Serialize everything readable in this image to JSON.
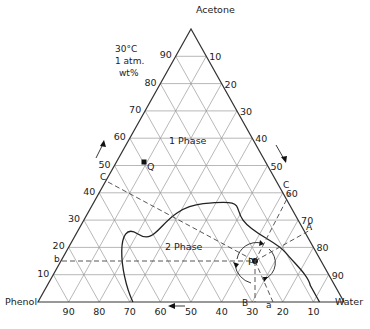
{
  "diagram": {
    "title_vertex_top": "Acetone",
    "vertex_left": "Phenol",
    "vertex_right": "Water",
    "conditions": [
      "30°C",
      "1 atm.",
      "wt%"
    ],
    "region_labels": {
      "one_phase": "1 Phase",
      "two_phase": "2 Phase"
    },
    "points": {
      "P": "P",
      "Q": "Q"
    },
    "line_labels": {
      "a": "a",
      "b": "b",
      "B": "B",
      "A": "A",
      "C_left": "C",
      "C_right": "C"
    },
    "left_ticks": [
      "10",
      "20",
      "30",
      "40",
      "50",
      "60",
      "70",
      "80",
      "90"
    ],
    "right_ticks": [
      "10",
      "20",
      "30",
      "40",
      "50",
      "60",
      "70",
      "80",
      "90"
    ],
    "bottom_ticks": [
      "90",
      "80",
      "70",
      "60",
      "50",
      "40",
      "30",
      "20",
      "10"
    ],
    "colors": {
      "grid": "#9a9a9a",
      "frame": "#333333",
      "curve": "#222222",
      "dash": "#444444"
    }
  },
  "chart_data": {
    "type": "ternary",
    "components": [
      "Acetone",
      "Phenol",
      "Water"
    ],
    "units": "wt%",
    "conditions": "30°C, 1 atm",
    "grid_step": 10,
    "regions": [
      "1 Phase",
      "2 Phase"
    ],
    "binodal_curve_approx": [
      {
        "phenol": 69,
        "water": 31,
        "acetone": 0
      },
      {
        "phenol": 66,
        "water": 22,
        "acetone": 12
      },
      {
        "phenol": 55,
        "water": 20,
        "acetone": 25
      },
      {
        "phenol": 40,
        "water": 25,
        "acetone": 35
      },
      {
        "phenol": 28,
        "water": 36,
        "acetone": 36
      },
      {
        "phenol": 18,
        "water": 52,
        "acetone": 30
      },
      {
        "phenol": 10,
        "water": 72,
        "acetone": 18
      },
      {
        "phenol": 8,
        "water": 86,
        "acetone": 6
      },
      {
        "phenol": 8,
        "water": 92,
        "acetone": 0
      }
    ],
    "points": [
      {
        "name": "P",
        "phenol": 33,
        "water": 52,
        "acetone": 15
      },
      {
        "name": "Q",
        "phenol": 43,
        "water": 5,
        "acetone": 52
      }
    ]
  }
}
